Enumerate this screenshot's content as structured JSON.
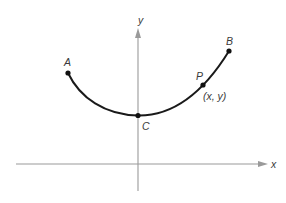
{
  "figure": {
    "axes": {
      "x_label": "x",
      "y_label": "y",
      "axis_color": "#9a9a9a"
    },
    "curve": {
      "color": "#1a1a1a",
      "description": "U-shaped curve from A through C (minimum on y-axis) and P to B"
    },
    "points": [
      {
        "id": "A",
        "label": "A"
      },
      {
        "id": "B",
        "label": "B"
      },
      {
        "id": "C",
        "label": "C"
      },
      {
        "id": "P",
        "label": "P",
        "coord_label": "(x, y)"
      }
    ]
  }
}
